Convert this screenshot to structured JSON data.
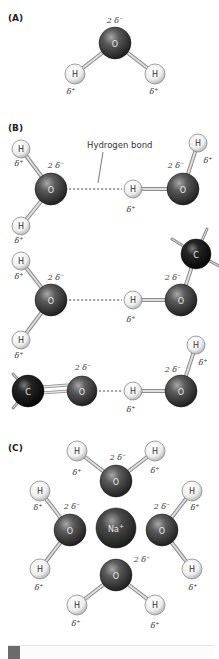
{
  "figure": {
    "panels": [
      {
        "id": "A",
        "label": "(A)",
        "x": 8,
        "y": 21
      },
      {
        "id": "B",
        "label": "(B)",
        "x": 8,
        "y": 131
      },
      {
        "id": "C",
        "label": "(C)",
        "x": 8,
        "y": 451
      }
    ],
    "annotation": {
      "text": "Hydrogen bond",
      "x": 87,
      "y": 148,
      "leader": [
        [
          103,
          152
        ],
        [
          98,
          183
        ]
      ]
    },
    "colors": {
      "oxygen": "#3c3c3c",
      "oxygen_hi": "#9a9a9a",
      "carbon": "#151515",
      "carbon_hi": "#777777",
      "hydrogen": "#f4f4f4",
      "hydrogen_edge": "#8a8a8a",
      "sodium": "#3a3a3a",
      "bond": "#bdbdbd",
      "bond_edge": "#8c8c8c",
      "hbond": "#555555"
    },
    "atoms": [
      {
        "el": "O",
        "x": 115,
        "y": 43,
        "r": 16,
        "label": "O"
      },
      {
        "el": "H",
        "x": 75,
        "y": 74,
        "r": 10,
        "label": "H"
      },
      {
        "el": "H",
        "x": 155,
        "y": 74,
        "r": 10,
        "label": "H"
      },
      {
        "el": "H",
        "x": 21,
        "y": 149,
        "r": 9,
        "label": "H"
      },
      {
        "el": "O",
        "x": 51,
        "y": 189,
        "r": 16,
        "label": "O"
      },
      {
        "el": "H",
        "x": 21,
        "y": 226,
        "r": 9,
        "label": "H"
      },
      {
        "el": "H",
        "x": 133,
        "y": 189,
        "r": 9,
        "label": "H"
      },
      {
        "el": "O",
        "x": 183,
        "y": 189,
        "r": 16,
        "label": "O"
      },
      {
        "el": "H",
        "x": 198,
        "y": 143,
        "r": 9,
        "label": "H"
      },
      {
        "el": "H",
        "x": 21,
        "y": 261,
        "r": 9,
        "label": "H"
      },
      {
        "el": "O",
        "x": 51,
        "y": 300,
        "r": 16,
        "label": "O"
      },
      {
        "el": "H",
        "x": 21,
        "y": 340,
        "r": 9,
        "label": "H"
      },
      {
        "el": "H",
        "x": 133,
        "y": 300,
        "r": 9,
        "label": "H"
      },
      {
        "el": "O",
        "x": 181,
        "y": 300,
        "r": 16,
        "label": "O"
      },
      {
        "el": "C",
        "x": 196,
        "y": 254,
        "r": 15,
        "label": "C"
      },
      {
        "el": "C",
        "x": 28,
        "y": 391,
        "r": 16,
        "label": "C"
      },
      {
        "el": "O",
        "x": 82,
        "y": 391,
        "r": 15,
        "label": "O"
      },
      {
        "el": "H",
        "x": 133,
        "y": 391,
        "r": 9,
        "label": "H"
      },
      {
        "el": "O",
        "x": 181,
        "y": 391,
        "r": 16,
        "label": "O"
      },
      {
        "el": "H",
        "x": 196,
        "y": 345,
        "r": 9,
        "label": "H"
      },
      {
        "el": "H",
        "x": 77,
        "y": 451,
        "r": 10,
        "label": "H"
      },
      {
        "el": "O",
        "x": 116,
        "y": 481,
        "r": 16,
        "label": "O"
      },
      {
        "el": "H",
        "x": 155,
        "y": 451,
        "r": 10,
        "label": "H"
      },
      {
        "el": "H",
        "x": 40,
        "y": 491,
        "r": 10,
        "label": "H"
      },
      {
        "el": "O",
        "x": 70,
        "y": 530,
        "r": 16,
        "label": "O"
      },
      {
        "el": "Na",
        "x": 116,
        "y": 528,
        "r": 20,
        "label": "Na+"
      },
      {
        "el": "O",
        "x": 162,
        "y": 530,
        "r": 16,
        "label": "O"
      },
      {
        "el": "H",
        "x": 192,
        "y": 491,
        "r": 10,
        "label": "H"
      },
      {
        "el": "H",
        "x": 40,
        "y": 569,
        "r": 10,
        "label": "H"
      },
      {
        "el": "H",
        "x": 192,
        "y": 569,
        "r": 10,
        "label": "H"
      },
      {
        "el": "O",
        "x": 116,
        "y": 575,
        "r": 16,
        "label": "O"
      },
      {
        "el": "H",
        "x": 77,
        "y": 605,
        "r": 10,
        "label": "H"
      },
      {
        "el": "H",
        "x": 155,
        "y": 605,
        "r": 10,
        "label": "H"
      }
    ],
    "bonds": [
      {
        "x1": 115,
        "y1": 43,
        "x2": 75,
        "y2": 74
      },
      {
        "x1": 115,
        "y1": 43,
        "x2": 155,
        "y2": 74
      },
      {
        "x1": 51,
        "y1": 189,
        "x2": 21,
        "y2": 149
      },
      {
        "x1": 51,
        "y1": 189,
        "x2": 21,
        "y2": 226
      },
      {
        "x1": 183,
        "y1": 189,
        "x2": 133,
        "y2": 189
      },
      {
        "x1": 183,
        "y1": 189,
        "x2": 198,
        "y2": 143
      },
      {
        "x1": 51,
        "y1": 300,
        "x2": 21,
        "y2": 261
      },
      {
        "x1": 51,
        "y1": 300,
        "x2": 21,
        "y2": 340
      },
      {
        "x1": 181,
        "y1": 300,
        "x2": 133,
        "y2": 300
      },
      {
        "x1": 181,
        "y1": 300,
        "x2": 196,
        "y2": 254
      },
      {
        "x1": 196,
        "y1": 254,
        "x2": 172,
        "y2": 239,
        "stub": true
      },
      {
        "x1": 196,
        "y1": 254,
        "x2": 207,
        "y2": 229,
        "stub": true
      },
      {
        "x1": 196,
        "y1": 254,
        "x2": 219,
        "y2": 266,
        "stub": true
      },
      {
        "x1": 28,
        "y1": 391,
        "x2": 82,
        "y2": 387,
        "double": true
      },
      {
        "x1": 28,
        "y1": 391,
        "x2": 13,
        "y2": 374,
        "stub": true
      },
      {
        "x1": 28,
        "y1": 391,
        "x2": 13,
        "y2": 408,
        "stub": true
      },
      {
        "x1": 181,
        "y1": 391,
        "x2": 133,
        "y2": 391
      },
      {
        "x1": 181,
        "y1": 391,
        "x2": 196,
        "y2": 345
      },
      {
        "x1": 116,
        "y1": 481,
        "x2": 77,
        "y2": 451
      },
      {
        "x1": 116,
        "y1": 481,
        "x2": 155,
        "y2": 451
      },
      {
        "x1": 70,
        "y1": 530,
        "x2": 40,
        "y2": 491
      },
      {
        "x1": 70,
        "y1": 530,
        "x2": 40,
        "y2": 569
      },
      {
        "x1": 162,
        "y1": 530,
        "x2": 192,
        "y2": 491
      },
      {
        "x1": 162,
        "y1": 530,
        "x2": 192,
        "y2": 569
      },
      {
        "x1": 116,
        "y1": 575,
        "x2": 77,
        "y2": 605
      },
      {
        "x1": 116,
        "y1": 575,
        "x2": 155,
        "y2": 605
      }
    ],
    "hydrogen_bonds": [
      {
        "x1": 69,
        "y1": 189,
        "x2": 122,
        "y2": 189
      },
      {
        "x1": 69,
        "y1": 300,
        "x2": 122,
        "y2": 300
      },
      {
        "x1": 99,
        "y1": 391,
        "x2": 122,
        "y2": 391
      }
    ],
    "charges": [
      {
        "text": "2 δ⁻",
        "x": 115,
        "y": 23
      },
      {
        "text": "δ⁺",
        "x": 71,
        "y": 94
      },
      {
        "text": "δ⁺",
        "x": 154,
        "y": 94
      },
      {
        "text": "δ⁺",
        "x": 19,
        "y": 166
      },
      {
        "text": "2 δ⁻",
        "x": 56,
        "y": 168
      },
      {
        "text": "2 δ⁻",
        "x": 176,
        "y": 168
      },
      {
        "text": "δ⁺",
        "x": 208,
        "y": 163
      },
      {
        "text": "δ⁺",
        "x": 131,
        "y": 212
      },
      {
        "text": "δ⁺",
        "x": 19,
        "y": 243
      },
      {
        "text": "δ⁺",
        "x": 19,
        "y": 279
      },
      {
        "text": "2 δ⁻",
        "x": 56,
        "y": 280
      },
      {
        "text": "2 δ⁻",
        "x": 173,
        "y": 280
      },
      {
        "text": "δ⁺",
        "x": 131,
        "y": 322
      },
      {
        "text": "δ⁺",
        "x": 19,
        "y": 358
      },
      {
        "text": "2 δ⁻",
        "x": 83,
        "y": 370
      },
      {
        "text": "2 δ⁻",
        "x": 173,
        "y": 372
      },
      {
        "text": "δ⁺",
        "x": 203,
        "y": 365
      },
      {
        "text": "δ⁺",
        "x": 131,
        "y": 412
      },
      {
        "text": "2 δ⁻",
        "x": 118,
        "y": 460
      },
      {
        "text": "δ⁺",
        "x": 77,
        "y": 475
      },
      {
        "text": "δ⁺",
        "x": 155,
        "y": 473
      },
      {
        "text": "δ⁺",
        "x": 38,
        "y": 510
      },
      {
        "text": "2 δ⁻",
        "x": 72,
        "y": 509
      },
      {
        "text": "2 δ⁻",
        "x": 162,
        "y": 509
      },
      {
        "text": "δ⁺",
        "x": 195,
        "y": 510
      },
      {
        "text": "δ⁺",
        "x": 39,
        "y": 590
      },
      {
        "text": "2 δ⁻",
        "x": 142,
        "y": 562
      },
      {
        "text": "δ⁺",
        "x": 193,
        "y": 590
      },
      {
        "text": "δ⁺",
        "x": 76,
        "y": 626
      },
      {
        "text": "δ⁺",
        "x": 155,
        "y": 628
      }
    ]
  }
}
